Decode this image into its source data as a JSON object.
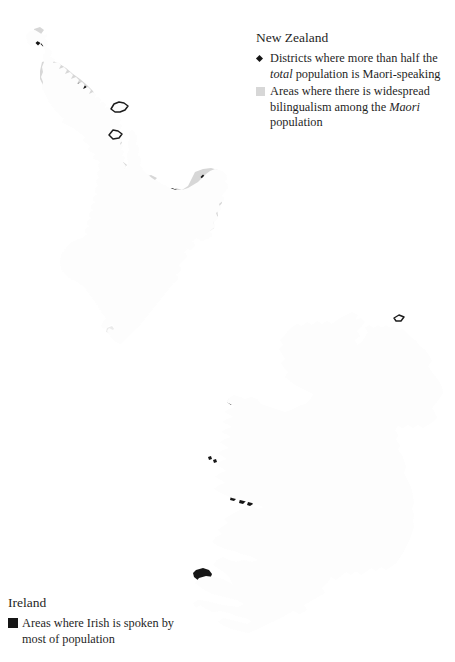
{
  "colors": {
    "line": "#1c1c1c",
    "land": "#fdfdfd",
    "bilingual_gray": "#d7d7d7",
    "black_area": "#161616",
    "page_bg": "#ffffff"
  },
  "nz_legend": {
    "title": "New Zealand",
    "item1_marker": "diamond-icon",
    "item1_pre": "Districts where more than half the",
    "item1_italic": "total",
    "item1_post": "population is Maori-speaking",
    "item2_marker": "gray-square-icon",
    "item2_pre": "Areas where there is widespread bilingualism among the",
    "item2_italic": "Maori",
    "item2_post": "population"
  },
  "ireland_legend": {
    "title": "Ireland",
    "item_marker": "black-square-icon",
    "item_text": "Areas where Irish is spoken by most of population"
  },
  "nz_map": {
    "district_points": [
      [
        37,
        37
      ],
      [
        42,
        39
      ],
      [
        38,
        43
      ],
      [
        43,
        44
      ],
      [
        50,
        80
      ],
      [
        54,
        84
      ],
      [
        51,
        88
      ],
      [
        56,
        90
      ],
      [
        79,
        85
      ],
      [
        84,
        87
      ],
      [
        80,
        91
      ],
      [
        85,
        93
      ],
      [
        82,
        96
      ],
      [
        163,
        197
      ],
      [
        162,
        210
      ],
      [
        203,
        177
      ],
      [
        217,
        192
      ]
    ]
  }
}
